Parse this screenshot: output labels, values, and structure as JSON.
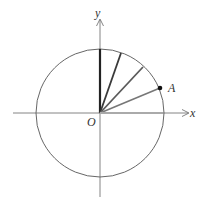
{
  "diagram": {
    "type": "unit-circle-rotation",
    "labels": {
      "x_axis": "x",
      "y_axis": "y",
      "origin": "O",
      "point": "A"
    },
    "origin": {
      "x": 100,
      "y": 113
    },
    "radius": 64,
    "rays": [
      {
        "name": "ray-90deg",
        "end": {
          "x": 100,
          "y": 49
        },
        "color": "#222222",
        "width": 2.2
      },
      {
        "name": "ray-72deg",
        "end": {
          "x": 121,
          "y": 53
        },
        "color": "#3a3a3a",
        "width": 1.8
      },
      {
        "name": "ray-50deg",
        "end": {
          "x": 143,
          "y": 67
        },
        "color": "#5a5a5a",
        "width": 1.8
      },
      {
        "name": "ray-A",
        "end": {
          "x": 160,
          "y": 88
        },
        "color": "#777777",
        "width": 1.6
      },
      {
        "name": "ray-0deg",
        "end": {
          "x": 163,
          "y": 113
        },
        "color": "#aaaaaa",
        "width": 2.0
      }
    ],
    "colors": {
      "axis": "#666666",
      "circle": "#555555",
      "point": "#111111"
    }
  }
}
